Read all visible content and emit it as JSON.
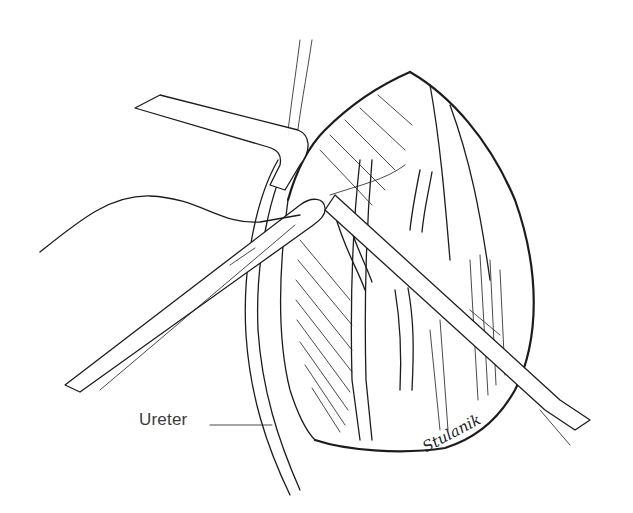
{
  "illustration": {
    "subject": "surgical line drawing: open abdominal incision with retractor, two forceps/clamps and suture thread",
    "labels": [
      {
        "text": "Ureter",
        "leader": "line to ureter structure on left of incision"
      }
    ],
    "signature": "Stulanik",
    "colors": {
      "ink": "#1c1c1c",
      "label": "#3a3a3a",
      "background": "#ffffff"
    }
  }
}
